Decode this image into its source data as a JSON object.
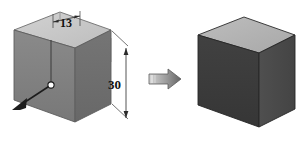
{
  "diagram": {
    "type": "engineering-3d-box-transformation",
    "background_color": "#ffffff",
    "left_figure": {
      "name": "dimensioned-box",
      "description": "Shaded 3D rectangular block in isometric view with a transparent wireframe upper extension, dimension annotations and a leader callout",
      "faces": {
        "top_color": "#c6c6c6",
        "left_color": "#808080",
        "front_color": "#6f6f6f",
        "ghost_color": "#b9b9b9",
        "edge_color": "#5a5a5a"
      },
      "dimensions": [
        {
          "name": "width-dimension",
          "label": "13",
          "orientation": "horizontal-depth",
          "position": "top"
        },
        {
          "name": "height-dimension",
          "label": "30",
          "orientation": "vertical",
          "position": "right"
        }
      ],
      "callout": {
        "name": "origin-point-callout",
        "marker": "white-dot",
        "marker_fill": "#ffffff",
        "marker_stroke": "#1a1a1a",
        "arrowhead": "solid-triangle",
        "direction": "down-left"
      }
    },
    "transition_arrow": {
      "name": "transformation-arrow",
      "direction": "right",
      "fill_start": "#c9c9c9",
      "fill_end": "#6b6b6b",
      "outline": "#555555"
    },
    "right_figure": {
      "name": "solid-box",
      "description": "Solid shaded 3D rectangular block in isometric view with no annotations",
      "faces": {
        "top_color": "#b4b4b4",
        "left_color": "#3c3c3c",
        "front_color": "#3c3c3c",
        "right_color": "#4c4c4c",
        "edge_color": "#2a2a2a"
      }
    }
  }
}
